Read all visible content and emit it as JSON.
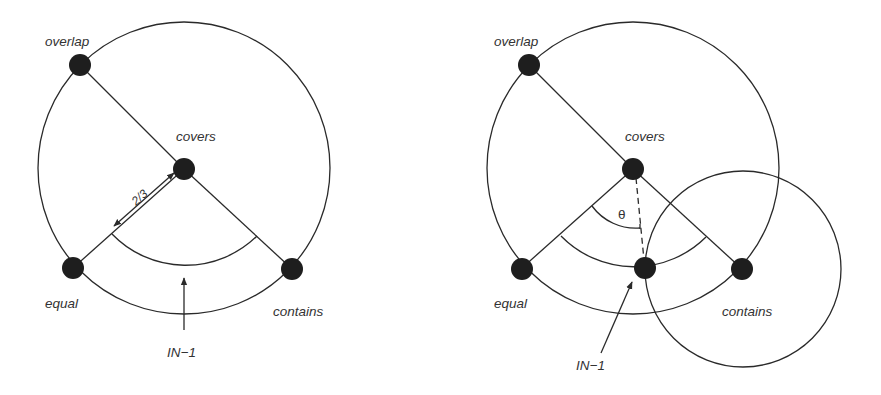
{
  "diagrams": [
    {
      "id": "left",
      "labels": {
        "overlap": "overlap",
        "covers": "covers",
        "equal": "equal",
        "contains": "contains",
        "in1": "IN−1",
        "ratio": "2/3"
      }
    },
    {
      "id": "right",
      "labels": {
        "overlap": "overlap",
        "covers": "covers",
        "equal": "equal",
        "contains": "contains",
        "in1": "IN−1",
        "angle": "θ"
      }
    }
  ],
  "colors": {
    "ink": "#1e1e1e",
    "text": "#333333",
    "background": "#ffffff"
  }
}
